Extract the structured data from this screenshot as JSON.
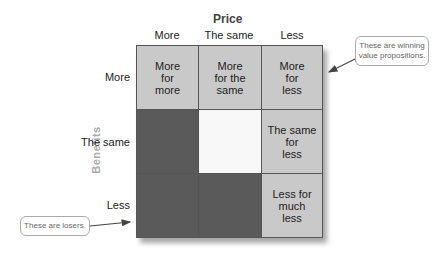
{
  "axes": {
    "price_title": "Price",
    "benefits_title": "Benefits",
    "columns": [
      "More",
      "The same",
      "Less"
    ],
    "rows": [
      "More",
      "The same",
      "Less"
    ]
  },
  "cells": [
    [
      "More\nfor\nmore",
      "More\nfor the\nsame",
      "More\nfor\nless"
    ],
    [
      "",
      "",
      "The same\nfor\nless"
    ],
    [
      "",
      "",
      "Less for\nmuch\nless"
    ]
  ],
  "cell_shades": [
    [
      "light",
      "light",
      "light"
    ],
    [
      "dark",
      "white",
      "light"
    ],
    [
      "dark",
      "dark",
      "light"
    ]
  ],
  "callouts": {
    "winning": "These are winning value propositions.",
    "losers": "These are losers."
  },
  "colors": {
    "light_cell": "#c9c9c9",
    "dark_cell": "#5a5a5a",
    "white_cell": "#f8f8f8",
    "benefits_label": "#aaaaaa"
  }
}
